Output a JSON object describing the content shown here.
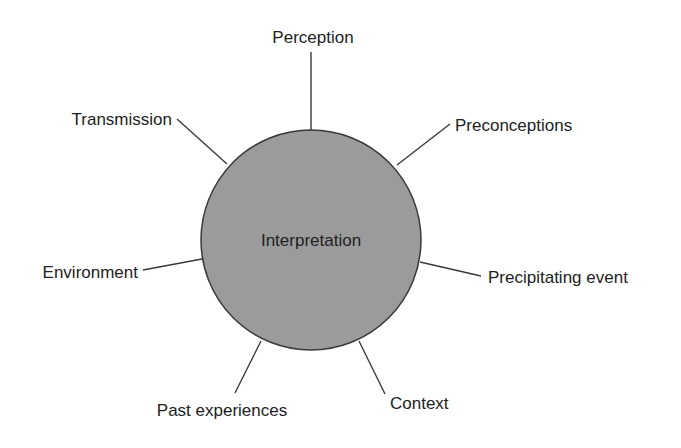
{
  "diagram": {
    "center": {
      "label": "Interpretation",
      "cx": 311,
      "cy": 240,
      "r": 110,
      "fill": "#9b9b9b",
      "stroke": "#3a3a3a"
    },
    "line_color": "#3a3a3a",
    "text_color": "#222222",
    "nodes": [
      {
        "label": "Perception",
        "x1": 311,
        "y1": 130,
        "x2": 311,
        "y2": 52,
        "tx": 313,
        "ty": 43,
        "anchor": "middle"
      },
      {
        "label": "Transmission",
        "x1": 227,
        "y1": 164,
        "x2": 177,
        "y2": 119,
        "tx": 172,
        "ty": 125,
        "anchor": "end"
      },
      {
        "label": "Preconceptions",
        "x1": 397,
        "y1": 165,
        "x2": 450,
        "y2": 124,
        "tx": 455,
        "ty": 131,
        "anchor": "start"
      },
      {
        "label": "Precipitating event",
        "x1": 420,
        "y1": 262,
        "x2": 481,
        "y2": 276,
        "tx": 488,
        "ty": 283,
        "anchor": "start"
      },
      {
        "label": "Environment",
        "x1": 202,
        "y1": 259,
        "x2": 143,
        "y2": 270,
        "tx": 138,
        "ty": 278,
        "anchor": "end"
      },
      {
        "label": "Past experiences",
        "x1": 261,
        "y1": 341,
        "x2": 235,
        "y2": 393,
        "tx": 222,
        "ty": 416,
        "anchor": "middle"
      },
      {
        "label": "Context",
        "x1": 359,
        "y1": 341,
        "x2": 385,
        "y2": 394,
        "tx": 390,
        "ty": 409,
        "anchor": "start"
      }
    ]
  }
}
